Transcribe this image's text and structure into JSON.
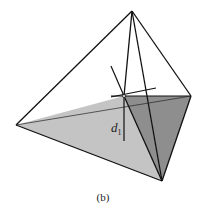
{
  "figure": {
    "caption": "(b)",
    "distance_label": "d",
    "distance_subscript": "1",
    "colors": {
      "light_face": "#c4c4c4",
      "dark_face": "#8e8e8e",
      "edge": "#111111"
    }
  }
}
